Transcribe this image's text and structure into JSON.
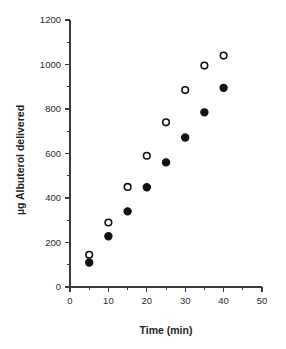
{
  "chart_data": {
    "type": "scatter",
    "title": "",
    "xlabel": "Time (min)",
    "ylabel": "µg Albuterol delivered",
    "xlim": [
      0,
      50
    ],
    "ylim": [
      0,
      1200
    ],
    "grid": false,
    "legend": "none",
    "x_ticks": [
      0,
      10,
      20,
      30,
      40,
      50
    ],
    "x_tick_labels": [
      "0",
      "10",
      "20",
      "30",
      "40",
      "50"
    ],
    "x_minor_ticks": [
      5,
      15,
      25,
      35,
      45
    ],
    "y_ticks": [
      0,
      200,
      400,
      600,
      800,
      1000,
      1200
    ],
    "y_tick_labels": [
      "0",
      "200",
      "400",
      "600",
      "800",
      "1000",
      "1200"
    ],
    "y_minor_ticks": [
      100,
      300,
      500,
      700,
      900,
      1100
    ],
    "x": [
      5,
      10,
      15,
      20,
      25,
      30,
      35,
      40
    ],
    "series": [
      {
        "name": "open-circles",
        "marker": "open-circle",
        "color": "#111111",
        "values": [
          145,
          290,
          450,
          590,
          740,
          885,
          995,
          1040
        ]
      },
      {
        "name": "filled-circles",
        "marker": "filled-circle",
        "color": "#111111",
        "values": [
          110,
          228,
          340,
          448,
          560,
          672,
          785,
          895
        ]
      }
    ]
  }
}
